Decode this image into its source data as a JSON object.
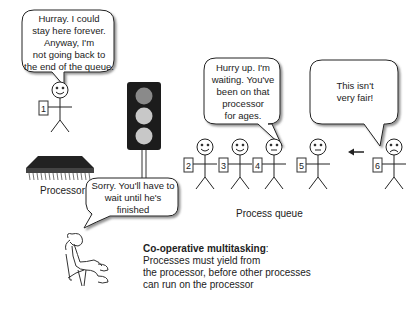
{
  "title": "Co-operative multitasking",
  "caption": {
    "heading": "Co-operative multitasking",
    "heading_suffix": ":",
    "lines": [
      "Processes must yield from",
      "the processor, before other processes",
      "can run on the processor"
    ]
  },
  "labels": {
    "processor": "Processor",
    "process_queue": "Process queue"
  },
  "bubbles": {
    "running_process": [
      "Hurray. I could",
      "stay here forever.",
      "Anyway, I'm",
      "not going back to",
      "the end of the queue."
    ],
    "scheduler": [
      "Sorry. You'll have to",
      "wait until he's",
      "finished"
    ],
    "process_4": [
      "Hurry up. I'm",
      "waiting. You've",
      "been on that",
      "processor",
      "for ages."
    ],
    "process_6": [
      "This isn't",
      "very fair!"
    ]
  },
  "processes": [
    {
      "id": "1",
      "mood": "happy",
      "location": "processor"
    },
    {
      "id": "2",
      "mood": "happy",
      "location": "queue"
    },
    {
      "id": "3",
      "mood": "happy",
      "location": "queue"
    },
    {
      "id": "4",
      "mood": "neutral",
      "location": "queue"
    },
    {
      "id": "5",
      "mood": "neutral",
      "location": "queue"
    },
    {
      "id": "6",
      "mood": "sad",
      "location": "arriving"
    }
  ],
  "traffic_light": {
    "state": "red",
    "colors": {
      "red": "#8a8a8a",
      "amber": "#c8c8c8",
      "green": "#c8c8c8",
      "body": "#1c1c1c"
    }
  },
  "icons": [
    "processor-chip-icon",
    "traffic-light-icon",
    "arrow-left-icon",
    "relaxing-person-icon"
  ]
}
